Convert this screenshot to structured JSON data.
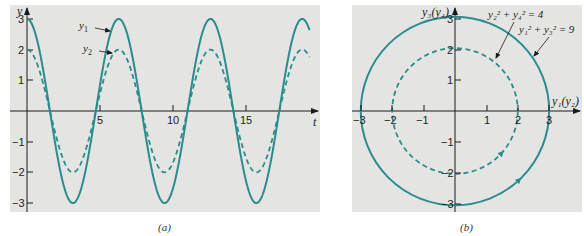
{
  "colors": {
    "curve": "#2a8c8c",
    "panel_bg": "#e4e5e3",
    "axis": "#1a1a1a"
  },
  "chart_data": [
    {
      "panel": "a",
      "type": "line",
      "caption": "(a)",
      "xlabel": "t",
      "ylabel": "y",
      "xlim": [
        0,
        19.5
      ],
      "ylim": [
        -3.3,
        3.3
      ],
      "xticks": [
        5,
        10,
        15
      ],
      "yticks": [
        -3,
        -2,
        -1,
        1,
        2,
        3
      ],
      "grid": false,
      "series": [
        {
          "name": "y1",
          "label": "y₁",
          "style": "solid",
          "formula": "3cos(t)",
          "amplitude": 3,
          "x": [
            0,
            1.57,
            3.14,
            4.71,
            6.28,
            7.85,
            9.42,
            10.99,
            12.57,
            14.14,
            15.71,
            17.28,
            18.85
          ],
          "values": [
            3,
            0,
            -3,
            0,
            3,
            0,
            -3,
            0,
            3,
            0,
            -3,
            0,
            3
          ]
        },
        {
          "name": "y2",
          "label": "y₂",
          "style": "dashed",
          "formula": "2cos(t)",
          "amplitude": 2,
          "x": [
            0,
            1.57,
            3.14,
            4.71,
            6.28,
            7.85,
            9.42,
            10.99,
            12.57,
            14.14,
            15.71,
            17.28,
            18.85
          ],
          "values": [
            2,
            0,
            -2,
            0,
            2,
            0,
            -2,
            0,
            2,
            0,
            -2,
            0,
            2
          ]
        }
      ]
    },
    {
      "panel": "b",
      "type": "line",
      "caption": "(b)",
      "xlabel": "y₁(y₂)",
      "ylabel": "y₃(y₄)",
      "xlim": [
        -3.3,
        4
      ],
      "ylim": [
        -3.3,
        3.3
      ],
      "xticks": [
        -3,
        -2,
        -1,
        1,
        2,
        3
      ],
      "yticks": [
        -3,
        -2,
        -1,
        1,
        2,
        3
      ],
      "grid": false,
      "series": [
        {
          "name": "outer circle",
          "style": "solid",
          "radius": 3,
          "equation": "y₁² + y₃² = 9",
          "direction": "clockwise"
        },
        {
          "name": "inner circle",
          "style": "dashed",
          "radius": 2,
          "equation": "y₂² + y₄² = 4",
          "direction": "clockwise"
        }
      ],
      "annotations": [
        {
          "text": "y₂² + y₄² = 4",
          "points_to": "inner circle"
        },
        {
          "text": "y₁² + y₃² = 9",
          "points_to": "outer circle"
        }
      ]
    }
  ],
  "panel_a": {
    "ylabel": "y",
    "xlabel": "t",
    "xticks": {
      "t5": "5",
      "t10": "10",
      "t15": "15"
    },
    "yticks": {
      "p3": "3",
      "p2": "2",
      "p1": "1",
      "m1": "−1",
      "m2": "−2",
      "m3": "−3"
    },
    "legend_y1": "y",
    "legend_y1_sub": "1",
    "legend_y2": "y",
    "legend_y2_sub": "2",
    "caption": "(a)"
  },
  "panel_b": {
    "ylabel": "y₃(y₄)",
    "xlabel": "y₁(y₂)",
    "xticks": {
      "m3": "−3",
      "m2": "−2",
      "m1": "−1",
      "p1": "1",
      "p2": "2",
      "p3": "3"
    },
    "yticks": {
      "p3": "3",
      "p2": "2",
      "p1": "1",
      "m1": "−1",
      "m2": "−2",
      "m3": "−3"
    },
    "eq_inner": "y₂² + y₄² = 4",
    "eq_outer": "y₁² + y₃² = 9",
    "caption": "(b)"
  }
}
